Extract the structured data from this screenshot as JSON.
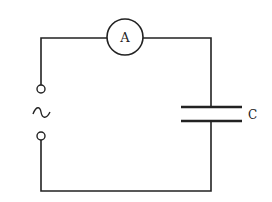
{
  "diagram": {
    "type": "circuit",
    "components": [
      {
        "id": "source",
        "kind": "ac-source",
        "symbol": "~"
      },
      {
        "id": "ammeter",
        "kind": "ammeter",
        "label": "A"
      },
      {
        "id": "capacitor",
        "kind": "capacitor",
        "label": "C"
      }
    ],
    "labels": {
      "ammeter": "A",
      "capacitor": "C",
      "source": "~"
    },
    "colors": {
      "wire": "#222222",
      "background": "#ffffff"
    }
  }
}
